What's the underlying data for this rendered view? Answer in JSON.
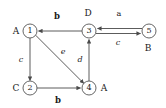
{
  "diagram": {
    "type": "directed-graph",
    "background_color": "#ffffff",
    "stroke_color": "#4a4a4a",
    "text_color": "#1a1a1a",
    "width": 166,
    "height": 108,
    "nodes": [
      {
        "id": "1",
        "number": "1",
        "tag": "A",
        "x": 30,
        "y": 31,
        "r": 7,
        "tag_x": 16,
        "tag_y": 31
      },
      {
        "id": "2",
        "number": "2",
        "tag": "C",
        "x": 30,
        "y": 88,
        "r": 7,
        "tag_x": 16,
        "tag_y": 88
      },
      {
        "id": "3",
        "number": "3",
        "tag": "D",
        "x": 89,
        "y": 31,
        "r": 7,
        "tag_x": 88,
        "tag_y": 13
      },
      {
        "id": "4",
        "number": "4",
        "tag": "A",
        "x": 89,
        "y": 88,
        "r": 7,
        "tag_x": 104,
        "tag_y": 88
      },
      {
        "id": "5",
        "number": "5",
        "tag": "B",
        "x": 149,
        "y": 31,
        "r": 7,
        "tag_x": 148,
        "tag_y": 48
      }
    ],
    "edges": [
      {
        "from": "3",
        "to": "1",
        "label": "b",
        "style": "bold",
        "label_x": 57,
        "label_y": 16
      },
      {
        "from": "1",
        "to": "2",
        "label": "c",
        "style": "italic",
        "label_x": 21,
        "label_y": 60
      },
      {
        "from": "1",
        "to": "4",
        "label": "e",
        "style": "italic",
        "label_x": 63,
        "label_y": 52
      },
      {
        "from": "4",
        "to": "3",
        "label": "d",
        "style": "italic",
        "label_x": 80,
        "label_y": 60
      },
      {
        "from": "2",
        "to": "4",
        "label": "b",
        "style": "bold",
        "label_x": 58,
        "label_y": 100
      },
      {
        "from": "5",
        "to": "3",
        "label": "a",
        "style": "plain",
        "label_x": 119,
        "label_y": 14
      },
      {
        "from": "3",
        "to": "5",
        "label": "c",
        "style": "italic",
        "label_x": 118,
        "label_y": 43
      }
    ]
  }
}
